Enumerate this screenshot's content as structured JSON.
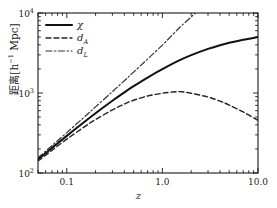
{
  "chart_data": {
    "type": "line",
    "title": "",
    "xlabel": "z",
    "ylabel_cjk": "距离",
    "ylabel_units": "[h⁻¹ Mpc]",
    "xscale": "log",
    "yscale": "log",
    "xlim": [
      0.05,
      10.0
    ],
    "ylim": [
      100,
      10000
    ],
    "grid": false,
    "legend_position": "upper left",
    "xticks_major": [
      0.1,
      1.0,
      10.0
    ],
    "xtick_labels": [
      "0.1",
      "1.0",
      "10.0"
    ],
    "yticks_major": [
      100,
      1000,
      10000
    ],
    "ytick_labels": [
      "10",
      "10",
      "10"
    ],
    "ytick_exponents": [
      "2",
      "3",
      "4"
    ],
    "series": [
      {
        "name": "χ",
        "label": "χ",
        "style": "solid",
        "color": "#111111",
        "width": 2.0,
        "x": [
          0.05,
          0.07,
          0.1,
          0.15,
          0.2,
          0.3,
          0.4,
          0.5,
          0.7,
          1.0,
          1.5,
          2.0,
          3.0,
          4.0,
          5.0,
          7.0,
          10.0
        ],
        "y": [
          148,
          206,
          291,
          428,
          559,
          800,
          1018,
          1216,
          1561,
          1985,
          2551,
          2974,
          3562,
          3953,
          4237,
          4629,
          5004
        ]
      },
      {
        "name": "d_A",
        "label": "d",
        "label_sub": "A",
        "style": "dashed",
        "color": "#222222",
        "width": 1.4,
        "x": [
          0.05,
          0.07,
          0.1,
          0.15,
          0.2,
          0.3,
          0.4,
          0.5,
          0.7,
          1.0,
          1.3,
          1.6,
          2.0,
          3.0,
          4.0,
          5.0,
          7.0,
          10.0
        ],
        "y": [
          141,
          192,
          265,
          372,
          466,
          615,
          727,
          811,
          918,
          993,
          1030,
          1037,
          991,
          891,
          791,
          706,
          579,
          455
        ]
      },
      {
        "name": "d_L",
        "label": "d",
        "label_sub": "L",
        "style": "dashdot",
        "color": "#333333",
        "width": 1.2,
        "x": [
          0.05,
          0.07,
          0.1,
          0.15,
          0.2,
          0.3,
          0.4,
          0.5,
          0.7,
          1.0,
          1.3,
          1.6,
          2.0,
          2.2
        ],
        "y": [
          155,
          220,
          320,
          492,
          671,
          1040,
          1425,
          1824,
          2654,
          3970,
          5460,
          7010,
          8920,
          10000
        ]
      }
    ],
    "annotations": []
  },
  "legend": {
    "entries": [
      {
        "label": "χ",
        "sub": "",
        "style": "solid"
      },
      {
        "label": "d",
        "sub": "A",
        "style": "dashed"
      },
      {
        "label": "d",
        "sub": "L",
        "style": "dashdot"
      }
    ]
  },
  "axes": {
    "x_label": "z",
    "y_label_cjk": "距离",
    "y_label_units": "[h",
    "y_label_units_exp": "−1",
    "y_label_units_tail": " Mpc]",
    "x_tick_labels": [
      "0.1",
      "1.0",
      "10.0"
    ],
    "y_tick_mantissa": "10",
    "y_tick_exponents": [
      "2",
      "3",
      "4"
    ]
  },
  "colors": {
    "background": "#ffffff",
    "axis": "#1a1a1a",
    "chi": "#111111",
    "dA": "#222222",
    "dL": "#333333"
  }
}
